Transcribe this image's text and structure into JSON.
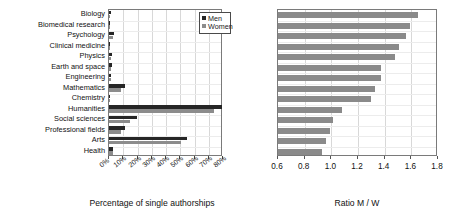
{
  "chart_data": [
    {
      "type": "bar",
      "orientation": "horizontal",
      "title": "",
      "xlabel": "Percentage of single authorships",
      "ylabel": "",
      "xlim": [
        0,
        80
      ],
      "xticks": [
        0,
        10,
        20,
        30,
        40,
        50,
        60,
        70,
        80
      ],
      "xticklabels": [
        "0%",
        "10%",
        "20%",
        "30%",
        "40%",
        "50%",
        "60%",
        "70%",
        "80%"
      ],
      "grid": true,
      "legend": {
        "position": "top-right",
        "entries": [
          "Men",
          "Women"
        ]
      },
      "categories": [
        "Biology",
        "Biomedical research",
        "Psychology",
        "Clinical medicine",
        "Physics",
        "Earth and space",
        "Engineering",
        "Mathematics",
        "Chemistry",
        "Humanities",
        "Social sciences",
        "Professional fields",
        "Arts",
        "Health"
      ],
      "series": [
        {
          "name": "Men",
          "color": "#262626",
          "values": [
            1.4,
            1.0,
            3.3,
            0.8,
            2.0,
            1.9,
            1.6,
            11.5,
            0.9,
            79.5,
            19.5,
            11.0,
            54.5,
            2.6
          ]
        },
        {
          "name": "Women",
          "color": "#8c8c8c",
          "values": [
            0.9,
            0.6,
            2.5,
            0.5,
            1.3,
            1.4,
            1.2,
            8.6,
            0.7,
            74.0,
            15.0,
            8.5,
            50.5,
            2.8
          ]
        }
      ]
    },
    {
      "type": "bar",
      "orientation": "horizontal",
      "title": "",
      "xlabel": "Ratio M / W",
      "ylabel": "",
      "xlim": [
        0.6,
        1.8
      ],
      "xticks": [
        0.6,
        0.8,
        1.0,
        1.2,
        1.4,
        1.6,
        1.8
      ],
      "xticklabels": [
        "0.6",
        "0.8",
        "1.0",
        "1.2",
        "1.4",
        "1.6",
        "1.8"
      ],
      "grid": true,
      "categories": [
        "Biology",
        "Biomedical research",
        "Psychology",
        "Clinical medicine",
        "Physics",
        "Earth and space",
        "Engineering",
        "Mathematics",
        "Chemistry",
        "Humanities",
        "Social sciences",
        "Professional fields",
        "Arts",
        "Health"
      ],
      "series": [
        {
          "name": "Ratio M / W",
          "color": "#8a8a8a",
          "values": [
            1.65,
            1.59,
            1.56,
            1.51,
            1.48,
            1.37,
            1.37,
            1.33,
            1.3,
            1.08,
            1.01,
            0.99,
            0.96,
            0.93
          ]
        }
      ]
    }
  ],
  "left": {
    "xlabel": "Percentage of single authorships",
    "legend": {
      "men": "Men",
      "women": "Women"
    }
  },
  "right": {
    "xlabel": "Ratio M / W"
  }
}
